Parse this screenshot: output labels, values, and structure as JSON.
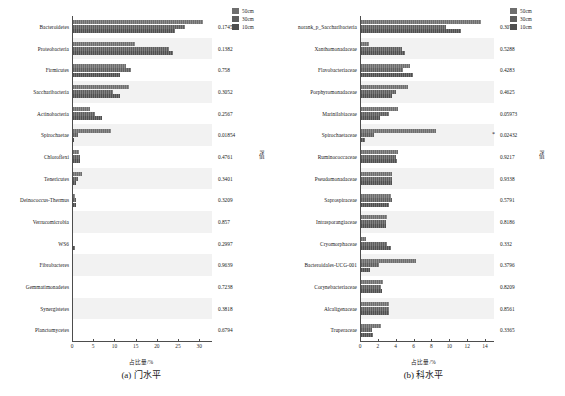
{
  "figure": {
    "legend": [
      {
        "label": "50cm",
        "color": "#6e6e6e"
      },
      {
        "label": "30cm",
        "color": "#5e5e5e"
      },
      {
        "label": "10cm",
        "color": "#4f4f4f"
      }
    ],
    "xlabel": "占比量/%",
    "pvalue_axis_label": "P值"
  },
  "chart_data": [
    {
      "type": "bar",
      "orientation": "horizontal",
      "panel": "a",
      "title": "(a) 门水平",
      "xlabel": "占比量/%",
      "ylabel": "",
      "xlim": [
        0,
        33
      ],
      "xticks": [
        0,
        5,
        10,
        15,
        20,
        25,
        30
      ],
      "grid": false,
      "legend_position": "top-right",
      "categories": [
        "Bacteroidetes",
        "Proteobacteria",
        "Firmicutes",
        "Saccharibacteria",
        "Actinobacteria",
        "Spirochaetae",
        "Chloroflexi",
        "Tenericutes",
        "Deinococcus-Thermus",
        "Verrucomicrobia",
        "WS6",
        "Fibrobacteres",
        "Gemmatimonadetes",
        "Synergistetes",
        "Planctomycetes"
      ],
      "series": [
        {
          "name": "50cm",
          "values": [
            30.8,
            14.9,
            12.7,
            13.5,
            4.2,
            9.2,
            1.6,
            2.3,
            0.8,
            0.18,
            0.1,
            0.16,
            0.12,
            0.1,
            0.26
          ]
        },
        {
          "name": "30cm",
          "values": [
            26.6,
            22.9,
            13.9,
            9.6,
            5.4,
            1.5,
            2.0,
            1.4,
            1.0,
            0.16,
            0.34,
            0.12,
            0.12,
            0.12,
            0.2
          ]
        },
        {
          "name": "10cm",
          "values": [
            24.3,
            23.9,
            11.4,
            11.3,
            7.0,
            0.5,
            1.9,
            0.9,
            0.9,
            0.14,
            0.66,
            0.1,
            0.1,
            0.1,
            0.16
          ]
        }
      ],
      "pvalues": [
        "0.1745",
        "0.1382",
        "0.758",
        "0.3052",
        "0.2567",
        "0.01854",
        "0.4761",
        "0.3401",
        "0.3209",
        "0.857",
        "0.2997",
        "0.9639",
        "0.7238",
        "0.3818",
        "0.6794"
      ],
      "significance": [
        "",
        "",
        "",
        "",
        "",
        "",
        "",
        "",
        "",
        "",
        "",
        "",
        "",
        "",
        ""
      ]
    },
    {
      "type": "bar",
      "orientation": "horizontal",
      "panel": "b",
      "title": "(b) 科水平",
      "xlabel": "占比量/%",
      "ylabel": "",
      "xlim": [
        0,
        15
      ],
      "xticks": [
        0,
        2,
        4,
        6,
        8,
        10,
        12,
        14
      ],
      "grid": false,
      "legend_position": "top-right",
      "categories": [
        "norank_p_Saccharibacteria",
        "Xanthomonadaceae",
        "Flavobacteriaceae",
        "Porphyromonadaceae",
        "Marinilabiaceae",
        "Spirochaetaceae",
        "Ruminococcaceae",
        "Pseudomonadaceae",
        "Saprospiraceae",
        "Intrasporangiaceae",
        "Cryomorphaceae",
        "Bacteroidales-UCG-001",
        "Corynebacteriaceae",
        "Alcaligenaceae",
        "Truperaceae"
      ],
      "series": [
        {
          "name": "50cm",
          "values": [
            13.5,
            1.0,
            5.6,
            5.4,
            4.3,
            8.5,
            4.2,
            3.6,
            3.5,
            3.0,
            0.7,
            6.3,
            2.6,
            3.3,
            2.3
          ]
        },
        {
          "name": "30cm",
          "values": [
            9.6,
            4.7,
            4.8,
            4.0,
            3.3,
            1.6,
            4.0,
            3.6,
            3.6,
            2.9,
            3.0,
            2.1,
            2.3,
            3.2,
            1.3
          ]
        },
        {
          "name": "10cm",
          "values": [
            11.3,
            5.0,
            5.9,
            3.6,
            2.2,
            0.6,
            4.1,
            3.6,
            3.2,
            2.9,
            3.5,
            1.1,
            2.5,
            3.3,
            1.5
          ]
        }
      ],
      "pvalues": [
        "0.3076",
        "0.5288",
        "0.4283",
        "0.4625",
        "0.05973",
        "0.02432",
        "0.9217",
        "0.9338",
        "0.5791",
        "0.8186",
        "0.332",
        "0.3796",
        "0.8209",
        "0.8561",
        "0.3365"
      ],
      "significance": [
        "",
        "",
        "",
        "",
        "",
        "*",
        "",
        "",
        "",
        "",
        "",
        "",
        "",
        "",
        ""
      ]
    }
  ]
}
